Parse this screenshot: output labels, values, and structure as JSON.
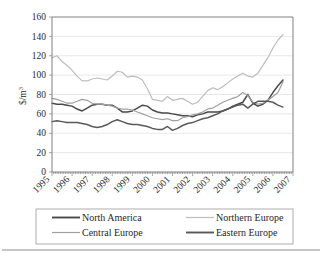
{
  "chart_data": {
    "type": "line",
    "title": "",
    "xlabel": "",
    "ylabel": "$/m3",
    "ylabel_base": "$/m",
    "ylabel_exponent": "3",
    "ylim": [
      0,
      160
    ],
    "ytick_step": 20,
    "yticks": [
      "0",
      "20",
      "40",
      "60",
      "80",
      "100",
      "120",
      "140",
      "160"
    ],
    "grid": true,
    "legend_position": "bottom",
    "x_axis_type": "category-years",
    "xticks": [
      "1995",
      "1996",
      "1997",
      "1998",
      "1999",
      "2000",
      "2001",
      "2002",
      "2003",
      "2004",
      "2005",
      "2006",
      "2007"
    ],
    "x_tick_rotation": 45,
    "x_minor_ticks_per_year": 12,
    "x": [
      1995.0,
      1995.25,
      1995.5,
      1995.75,
      1996.0,
      1996.25,
      1996.5,
      1996.75,
      1997.0,
      1997.25,
      1997.5,
      1997.75,
      1998.0,
      1998.25,
      1998.5,
      1998.75,
      1999.0,
      1999.25,
      1999.5,
      1999.75,
      2000.0,
      2000.25,
      2000.5,
      2000.75,
      2001.0,
      2001.25,
      2001.5,
      2001.75,
      2002.0,
      2002.25,
      2002.5,
      2002.75,
      2003.0,
      2003.25,
      2003.5,
      2003.75,
      2004.0,
      2004.25,
      2004.5,
      2004.75,
      2005.0,
      2005.25,
      2005.5,
      2005.75,
      2006.0,
      2006.25,
      2006.5
    ],
    "series": [
      {
        "name": "North America",
        "color": "#4a4a4a",
        "width": 1.5,
        "values": [
          71,
          70,
          70,
          69,
          68,
          65,
          63,
          66,
          69,
          70,
          70,
          69,
          69,
          66,
          62,
          62,
          63,
          66,
          69,
          68,
          64,
          62,
          61,
          61,
          60,
          59,
          58,
          58,
          57,
          59,
          60,
          62,
          62,
          62,
          63,
          65,
          68,
          70,
          72,
          80,
          71,
          68,
          70,
          74,
          82,
          89,
          95
        ]
      },
      {
        "name": "Northern Europe",
        "color": "#bdbdbd",
        "width": 1.2,
        "values": [
          118,
          120,
          114,
          110,
          105,
          99,
          94,
          94,
          96,
          97,
          96,
          95,
          99,
          104,
          103,
          98,
          99,
          98,
          95,
          86,
          75,
          74,
          73,
          78,
          74,
          75,
          76,
          73,
          70,
          72,
          78,
          84,
          87,
          85,
          88,
          92,
          96,
          99,
          102,
          99,
          98,
          102,
          110,
          118,
          128,
          136,
          142
        ]
      },
      {
        "name": "Central Europe",
        "color": "#a0a0a0",
        "width": 1.2,
        "values": [
          76,
          75,
          73,
          71,
          71,
          73,
          75,
          74,
          71,
          70,
          70,
          69,
          68,
          66,
          65,
          65,
          64,
          62,
          60,
          58,
          56,
          55,
          54,
          55,
          53,
          53,
          56,
          57,
          59,
          60,
          62,
          65,
          66,
          69,
          72,
          74,
          76,
          78,
          82,
          79,
          72,
          70,
          71,
          74,
          78,
          82,
          93
        ]
      },
      {
        "name": "Eastern Europe",
        "color": "#595959",
        "width": 1.5,
        "values": [
          52,
          53,
          52,
          51,
          51,
          51,
          50,
          49,
          47,
          46,
          47,
          49,
          52,
          54,
          52,
          50,
          49,
          49,
          48,
          47,
          45,
          44,
          44,
          47,
          43,
          45,
          48,
          50,
          51,
          53,
          55,
          56,
          58,
          60,
          63,
          65,
          67,
          69,
          70,
          66,
          70,
          73,
          73,
          73,
          72,
          69,
          67
        ]
      }
    ]
  },
  "legend": {
    "entries": [
      {
        "label": "North America",
        "color": "#4a4a4a"
      },
      {
        "label": "Northern Europe",
        "color": "#bdbdbd"
      },
      {
        "label": "Central Europe",
        "color": "#a0a0a0"
      },
      {
        "label": "Eastern Europe",
        "color": "#595959"
      }
    ]
  }
}
